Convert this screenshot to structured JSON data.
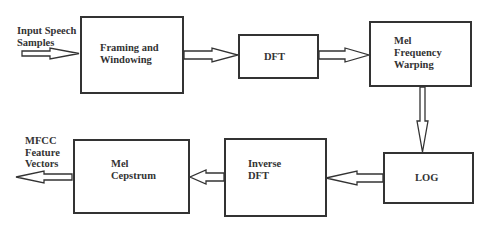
{
  "diagram": {
    "input_label": "Input Speech\nSamples",
    "output_label": "MFCC\nFeature\nVectors",
    "blocks": [
      {
        "id": "framing",
        "label": "Framing and\nWindowing"
      },
      {
        "id": "dft",
        "label": "DFT"
      },
      {
        "id": "mel-warping",
        "label": "Mel\nFrequency\nWarping"
      },
      {
        "id": "log",
        "label": "LOG"
      },
      {
        "id": "inverse-dft",
        "label": "Inverse\nDFT"
      },
      {
        "id": "mel-cepstrum",
        "label": "Mel\nCepstrum"
      }
    ],
    "edges": [
      {
        "from": "input",
        "to": "framing"
      },
      {
        "from": "framing",
        "to": "dft"
      },
      {
        "from": "dft",
        "to": "mel-warping"
      },
      {
        "from": "mel-warping",
        "to": "log"
      },
      {
        "from": "log",
        "to": "inverse-dft"
      },
      {
        "from": "inverse-dft",
        "to": "mel-cepstrum"
      },
      {
        "from": "mel-cepstrum",
        "to": "output"
      }
    ],
    "colors": {
      "stroke": "#333333",
      "background": "#ffffff"
    }
  }
}
